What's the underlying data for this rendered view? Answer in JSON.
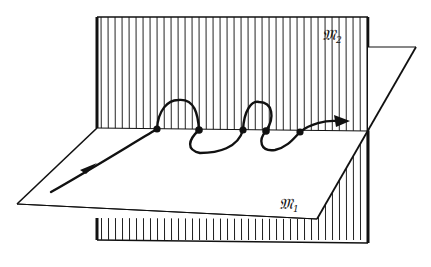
{
  "figure": {
    "planes": [
      {
        "id": "M2",
        "label": "M",
        "subscript": "2",
        "orientation": "vertical",
        "fill": "hatched-vertical"
      },
      {
        "id": "M1",
        "label": "M",
        "subscript": "1",
        "orientation": "horizontal",
        "fill": "white"
      }
    ],
    "curve": {
      "direction": "left-to-right",
      "intersection_points": 5,
      "arrows": 2
    },
    "colors": {
      "ink": "#111111",
      "background": "#ffffff"
    }
  }
}
